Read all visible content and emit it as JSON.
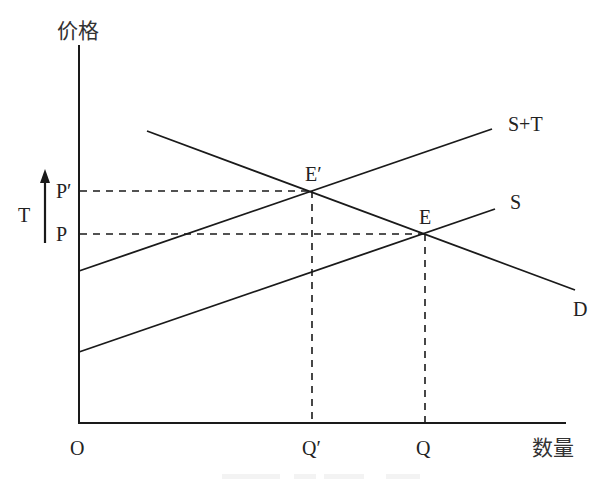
{
  "diagram": {
    "type": "supply-demand-tax",
    "axes": {
      "y_label": "价格",
      "x_label": "数量",
      "origin_label": "O"
    },
    "curves": [
      {
        "id": "supply_plus_tax",
        "label": "S+T"
      },
      {
        "id": "supply",
        "label": "S"
      },
      {
        "id": "demand",
        "label": "D"
      }
    ],
    "points": {
      "new_equilibrium": "E′",
      "equilibrium": "E"
    },
    "price_labels": {
      "new_price": "P′",
      "price": "P"
    },
    "quantity_labels": {
      "new_quantity": "Q′",
      "quantity": "Q"
    },
    "tax_label": "T"
  },
  "colors": {
    "line": "#1a1a1a",
    "text": "#222222",
    "background": "#ffffff"
  }
}
